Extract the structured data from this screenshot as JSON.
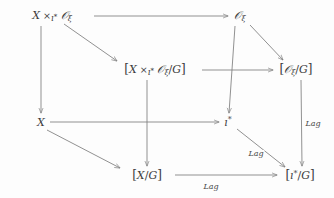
{
  "diagram": {
    "kind": "commutative-cube",
    "background_color": "#fdfdfd",
    "stroke_color": "#7d7d7d",
    "text_color": "#3b3b3b",
    "nodes": [
      {
        "id": "fiber-product",
        "label": "X ×_{g*} O_ξ",
        "x": 52,
        "y": 16,
        "role": "top-back-left"
      },
      {
        "id": "coadjoint-orbit",
        "label": "O_ξ",
        "x": 240,
        "y": 16,
        "role": "top-back-right"
      },
      {
        "id": "fiber-product-quotient",
        "label": "[X ×_{g*} O_ξ /G]",
        "x": 155,
        "y": 70,
        "role": "top-front-left"
      },
      {
        "id": "orbit-quotient",
        "label": "[O_ξ /G]",
        "x": 296,
        "y": 70,
        "role": "top-front-right"
      },
      {
        "id": "space-x",
        "label": "X",
        "x": 41,
        "y": 122,
        "role": "bottom-back-left"
      },
      {
        "id": "dual-lie-algebra",
        "label": "g*",
        "x": 228,
        "y": 122,
        "role": "bottom-back-right"
      },
      {
        "id": "x-quotient",
        "label": "[X/G]",
        "x": 147,
        "y": 175,
        "role": "bottom-front-left"
      },
      {
        "id": "dual-lie-algebra-quotient",
        "label": "[g*/G]",
        "x": 300,
        "y": 175,
        "role": "bottom-front-right"
      }
    ],
    "edge_labels": [
      {
        "id": "lag-right-vertical",
        "text": "Lag",
        "x": 313,
        "y": 124
      },
      {
        "id": "lag-diagonal",
        "text": "Lag",
        "x": 256,
        "y": 154
      },
      {
        "id": "lag-bottom",
        "text": "Lag",
        "x": 211,
        "y": 187
      }
    ]
  }
}
